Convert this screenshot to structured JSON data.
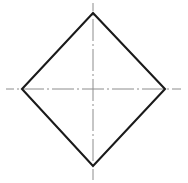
{
  "canvas": {
    "width": 188,
    "height": 183,
    "background_color": "#ffffff"
  },
  "drawing": {
    "title": "Rhombus with centerlines",
    "shape_name": "rhombus",
    "outline_color": "#1a1a1a",
    "outline_width": 2.1,
    "centerline_color": "#8c8c8c",
    "centerline_width": 1,
    "centerline_dash_pattern": "22 3 2 3",
    "vertices": {
      "top": {
        "x": 93,
        "y": 13
      },
      "right": {
        "x": 165,
        "y": 89
      },
      "bottom": {
        "x": 93,
        "y": 166
      },
      "left": {
        "x": 22,
        "y": 89
      }
    },
    "polygon_points": "93,13 165,89 93,166 22,89",
    "horizontal_centerline": {
      "x1": 6,
      "y1": 89,
      "x2": 181,
      "y2": 89
    },
    "vertical_centerline": {
      "x1": 93,
      "y1": 3,
      "x2": 93,
      "y2": 180
    },
    "center": {
      "x": 93,
      "y": 89
    }
  }
}
